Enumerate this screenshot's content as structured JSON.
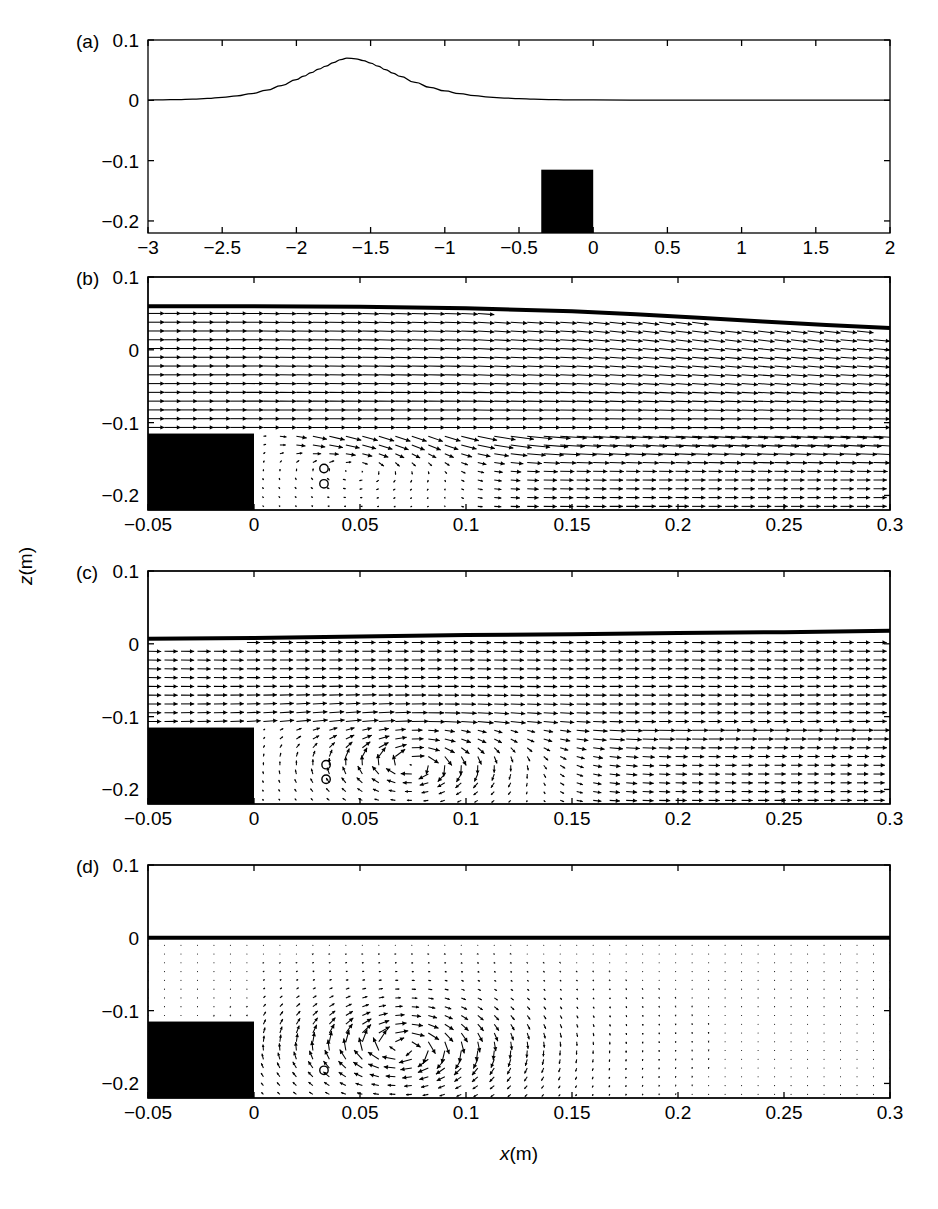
{
  "figure": {
    "axis_titles": {
      "x": "x(m)",
      "x_italic": "x",
      "x_rest": "(m)",
      "z": "z(m)",
      "z_italic": "z",
      "z_rest": "(m)"
    },
    "panel_labels": [
      "(a)",
      "(b)",
      "(c)",
      "(d)"
    ]
  },
  "chart_data": [
    {
      "panel": "(a)",
      "type": "line",
      "title": "",
      "xlabel": "",
      "ylabel": "z(m)",
      "xlim": [
        -3,
        2
      ],
      "ylim": [
        -0.22,
        0.1
      ],
      "xticks": [
        -3,
        -2.5,
        -2,
        -1.5,
        -1,
        -0.5,
        0,
        0.5,
        1,
        1.5,
        2
      ],
      "xticklabels": [
        "-3",
        "-2.5",
        "-2",
        "-1.5",
        "-1",
        "-0.5",
        "0",
        "0.5",
        "1",
        "1.5",
        "2"
      ],
      "yticks": [
        0.1,
        0,
        -0.1,
        -0.2
      ],
      "yticklabels": [
        "0.1",
        "0",
        "-0.1",
        "-0.2"
      ],
      "grid": false,
      "legend": "none",
      "series": [
        {
          "name": "free-surface-elevation",
          "comment": "solitary wave pulse, peak amplitude 0.07 m at x = -1.66 m",
          "x": [
            -3.0,
            -2.9,
            -2.8,
            -2.7,
            -2.6,
            -2.5,
            -2.4,
            -2.3,
            -2.2,
            -2.1,
            -2.0,
            -1.95,
            -1.9,
            -1.85,
            -1.8,
            -1.75,
            -1.7,
            -1.66,
            -1.6,
            -1.55,
            -1.5,
            -1.45,
            -1.4,
            -1.35,
            -1.3,
            -1.2,
            -1.1,
            -1.0,
            -0.9,
            -0.8,
            -0.7,
            -0.6,
            -0.5,
            -0.4,
            -0.3,
            -0.2,
            -0.1,
            0.0,
            0.5,
            1.0,
            1.5,
            2.0
          ],
          "y": [
            0.0005,
            0.0008,
            0.0013,
            0.002,
            0.0031,
            0.0048,
            0.0074,
            0.0113,
            0.0168,
            0.0245,
            0.0345,
            0.0402,
            0.0459,
            0.0516,
            0.0568,
            0.0626,
            0.0676,
            0.07,
            0.0689,
            0.066,
            0.0618,
            0.0566,
            0.0509,
            0.0452,
            0.0397,
            0.0296,
            0.0216,
            0.0155,
            0.011,
            0.0078,
            0.0054,
            0.0038,
            0.0026,
            0.0018,
            0.0013,
            0.0009,
            0.0007,
            0.0006,
            0.0004,
            0.0004,
            0.0004,
            0.0004
          ]
        }
      ],
      "shapes": [
        {
          "name": "submerged-block",
          "type": "rect",
          "x0": -0.35,
          "x1": 0.0,
          "z_top": -0.115,
          "z_bottom": -0.22,
          "fill": "#000000"
        }
      ]
    },
    {
      "panel": "(b)",
      "type": "quiver",
      "title": "",
      "xlabel": "",
      "ylabel": "z(m)",
      "xlim": [
        -0.05,
        0.3
      ],
      "ylim": [
        -0.22,
        0.1
      ],
      "xticks": [
        -0.05,
        0,
        0.05,
        0.1,
        0.15,
        0.2,
        0.25,
        0.3
      ],
      "xticklabels": [
        "-0.05",
        "0",
        "0.05",
        "0.1",
        "0.15",
        "0.2",
        "0.25",
        "0.3"
      ],
      "yticks": [
        0.1,
        0,
        -0.1,
        -0.2
      ],
      "yticklabels": [
        "0.1",
        "0",
        "-0.1",
        "-0.2"
      ],
      "grid": false,
      "legend": "none",
      "free_surface": {
        "name": "free-surface",
        "x": [
          -0.05,
          0.0,
          0.05,
          0.1,
          0.15,
          0.18,
          0.21,
          0.24,
          0.27,
          0.3
        ],
        "z": [
          0.06,
          0.06,
          0.059,
          0.057,
          0.053,
          0.049,
          0.044,
          0.039,
          0.034,
          0.03
        ]
      },
      "vortex_centers": [
        {
          "x": 0.033,
          "z": -0.163
        },
        {
          "x": 0.033,
          "z": -0.184
        }
      ],
      "shapes": [
        {
          "name": "submerged-block",
          "type": "rect",
          "x0": -0.05,
          "x1": 0.0,
          "z_top": -0.115,
          "z_bottom": -0.22,
          "fill": "#000000"
        }
      ],
      "flow": {
        "regime": "strong-uniform-forward-flow-above-block",
        "description": "nearly horizontal rightward vectors above block level; weak incipient recirculation in lee of block",
        "u_max": 1.0,
        "eddy_strength": 0.22
      }
    },
    {
      "panel": "(c)",
      "type": "quiver",
      "title": "",
      "xlabel": "",
      "ylabel": "z(m)",
      "xlim": [
        -0.05,
        0.3
      ],
      "ylim": [
        -0.22,
        0.1
      ],
      "xticks": [
        -0.05,
        0,
        0.05,
        0.1,
        0.15,
        0.2,
        0.25,
        0.3
      ],
      "xticklabels": [
        "-0.05",
        "0",
        "0.05",
        "0.1",
        "0.15",
        "0.2",
        "0.25",
        "0.3"
      ],
      "yticks": [
        0.1,
        0,
        -0.1,
        -0.2
      ],
      "yticklabels": [
        "0.1",
        "0",
        "-0.1",
        "-0.2"
      ],
      "grid": false,
      "legend": "none",
      "free_surface": {
        "name": "free-surface",
        "x": [
          -0.05,
          0.0,
          0.05,
          0.1,
          0.15,
          0.2,
          0.25,
          0.3
        ],
        "z": [
          0.007,
          0.008,
          0.01,
          0.012,
          0.013,
          0.015,
          0.016,
          0.018
        ]
      },
      "vortex_centers": [
        {
          "x": 0.034,
          "z": -0.166
        },
        {
          "x": 0.034,
          "z": -0.186
        }
      ],
      "shapes": [
        {
          "name": "submerged-block",
          "type": "rect",
          "x0": -0.05,
          "x1": 0.0,
          "z_top": -0.115,
          "z_bottom": -0.22,
          "fill": "#000000"
        }
      ],
      "flow": {
        "regime": "forward-flow-with-developed-lee-vortex",
        "description": "rightward flow above block; large clockwise recirculating eddy centred near x=0.075 m, z=-0.165 m",
        "u_max": 0.85,
        "eddy_strength": 0.85,
        "eddy_center": {
          "x": 0.075,
          "z": -0.165
        },
        "eddy_radius": 0.055
      }
    },
    {
      "panel": "(d)",
      "type": "quiver",
      "title": "",
      "xlabel": "x(m)",
      "ylabel": "z(m)",
      "xlim": [
        -0.05,
        0.3
      ],
      "ylim": [
        -0.22,
        0.1
      ],
      "xticks": [
        -0.05,
        0,
        0.05,
        0.1,
        0.15,
        0.2,
        0.25,
        0.3
      ],
      "xticklabels": [
        "-0.05",
        "0",
        "0.05",
        "0.1",
        "0.15",
        "0.2",
        "0.25",
        "0.3"
      ],
      "yticks": [
        0.1,
        0,
        -0.1,
        -0.2
      ],
      "yticklabels": [
        "0.1",
        "0",
        "-0.1",
        "-0.2"
      ],
      "grid": false,
      "legend": "none",
      "free_surface": {
        "name": "free-surface",
        "x": [
          -0.05,
          0.0,
          0.05,
          0.1,
          0.15,
          0.2,
          0.25,
          0.3
        ],
        "z": [
          0.0,
          0.0,
          0.0,
          0.0,
          0.0,
          0.0,
          0.0,
          0.0
        ]
      },
      "vortex_centers": [
        {
          "x": 0.033,
          "z": -0.182
        }
      ],
      "shapes": [
        {
          "name": "submerged-block",
          "type": "rect",
          "x0": -0.05,
          "x1": 0.0,
          "z_top": -0.115,
          "z_bottom": -0.22,
          "fill": "#000000"
        }
      ],
      "flow": {
        "regime": "isolated-vortex-quiescent-far-field",
        "description": "no mean current; strong clockwise vortex centred near x=0.070 m, z=-0.150 m, decaying towards x=0.3 m",
        "u_max": 0.1,
        "eddy_strength": 1.0,
        "eddy_center": {
          "x": 0.07,
          "z": -0.15
        },
        "eddy_radius": 0.07
      }
    }
  ]
}
